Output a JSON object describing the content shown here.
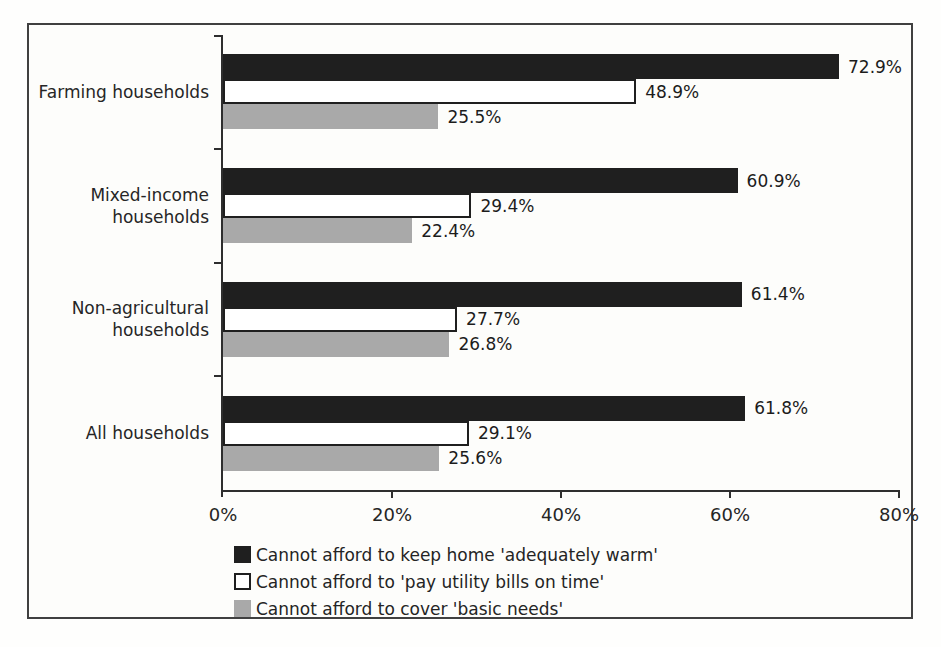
{
  "chart_data": {
    "type": "bar",
    "orientation": "horizontal",
    "title": "",
    "xlim": [
      0,
      80
    ],
    "x_ticks": [
      "0%",
      "20%",
      "40%",
      "60%",
      "80%"
    ],
    "grid": false,
    "legend_position": "bottom",
    "categories": [
      {
        "name": "Farming households",
        "lines": [
          "Farming households"
        ]
      },
      {
        "name": "Mixed-income households",
        "lines": [
          "Mixed-income",
          "households"
        ]
      },
      {
        "name": "Non-agricultural households",
        "lines": [
          "Non-agricultural",
          "households"
        ]
      },
      {
        "name": "All households",
        "lines": [
          "All households"
        ]
      }
    ],
    "series": [
      {
        "name": "Cannot afford to keep home 'adequately warm'",
        "color": "#1f1f1f",
        "style": "solid-black",
        "values": [
          72.9,
          60.9,
          61.4,
          61.8
        ],
        "labels": [
          "72.9%",
          "60.9%",
          "61.4%",
          "61.8%"
        ]
      },
      {
        "name": "Cannot afford to 'pay utility bills on time'",
        "color": "#ffffff",
        "style": "white-outlined",
        "values": [
          48.9,
          29.4,
          27.7,
          29.1
        ],
        "labels": [
          "48.9%",
          "29.4%",
          "27.7%",
          "29.1%"
        ]
      },
      {
        "name": "Cannot afford to cover 'basic needs'",
        "color": "#a9a9a9",
        "style": "solid-gray",
        "values": [
          25.5,
          22.4,
          26.8,
          25.6
        ],
        "labels": [
          "25.5%",
          "22.4%",
          "26.8%",
          "25.6%"
        ]
      }
    ],
    "colors": {
      "axis": "#2e2e2e",
      "text": "#262626",
      "frame_border": "#404040",
      "background": "#fdfdfb"
    }
  }
}
